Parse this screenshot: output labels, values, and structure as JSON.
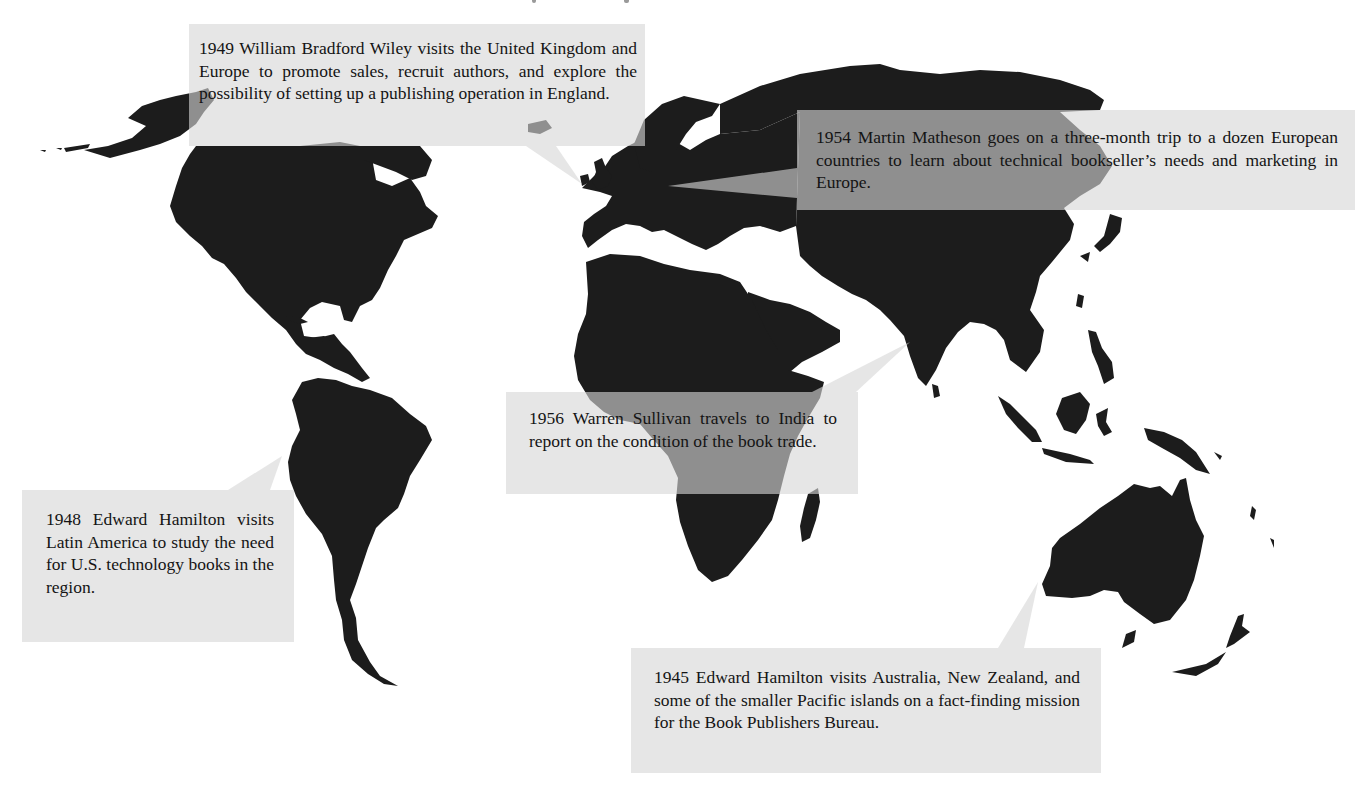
{
  "map": {
    "type": "world-map-silhouette",
    "land_color": "#1c1c1c",
    "background_color": "#ffffff",
    "callout_color": "#d6d6d6"
  },
  "callouts": [
    {
      "id": "1949",
      "year": "1949",
      "region": "United Kingdom and Europe",
      "text": "1949 William Bradford Wiley visits the United Kingdom and Europe to promote sales, recruit authors, and explore the possibility of setting up a publishing operation in England."
    },
    {
      "id": "1954",
      "year": "1954",
      "region": "Europe",
      "text": "1954 Martin Matheson goes on a three-month trip to a dozen European countries to learn about technical bookseller’s needs and marketing in Europe."
    },
    {
      "id": "1956",
      "year": "1956",
      "region": "India",
      "text": "1956 Warren Sullivan travels to India to report on the condition of the book trade."
    },
    {
      "id": "1948",
      "year": "1948",
      "region": "Latin America",
      "text": "1948 Edward Hamilton visits Latin America to study the need for U.S. technology books in the region."
    },
    {
      "id": "1945",
      "year": "1945",
      "region": "Australia, New Zealand, Pacific islands",
      "text": "1945 Edward Hamilton visits Australia, New Zealand, and some of the smaller Pacific islands on a fact-finding mission for the Book Publishers Bureau."
    }
  ]
}
